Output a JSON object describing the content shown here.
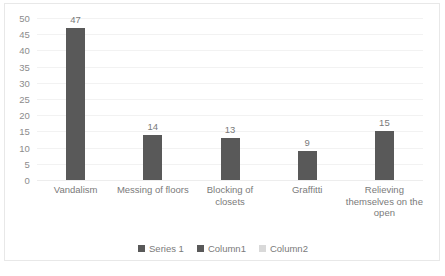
{
  "chart_data": {
    "type": "bar",
    "title": "",
    "subtitle": "",
    "xlabel": "",
    "ylabel": "",
    "categories": [
      "Vandalism",
      "Messing of floors",
      "Blocking of closets",
      "Graffitti",
      "Relieving themselves on the open"
    ],
    "values": [
      47,
      14,
      13,
      9,
      15
    ],
    "data_labels": [
      "47",
      "14",
      "13",
      "9",
      "15"
    ],
    "series": [
      {
        "name": "Series 1",
        "values": [
          47,
          14,
          13,
          9,
          15
        ]
      }
    ],
    "ylim": [
      0,
      50
    ],
    "ytick_step": 5,
    "yticks": [
      "50",
      "45",
      "40",
      "35",
      "30",
      "25",
      "20",
      "15",
      "10",
      "5",
      "0"
    ],
    "grid": true,
    "grid_axis": "y",
    "legend_position": "bottom",
    "legend": [
      {
        "label": "Series 1",
        "color": "#595959"
      },
      {
        "label": "Column1",
        "color": "#595959"
      },
      {
        "label": "Column2",
        "color": "#d9d9d9"
      }
    ],
    "colors": {
      "bar": "#595959",
      "gridline": "#f2f2f2",
      "tick_text": "#8c8c8c",
      "label_text": "#7a7a7a",
      "frame_border": "#e8e8e8",
      "background": "#ffffff"
    }
  }
}
